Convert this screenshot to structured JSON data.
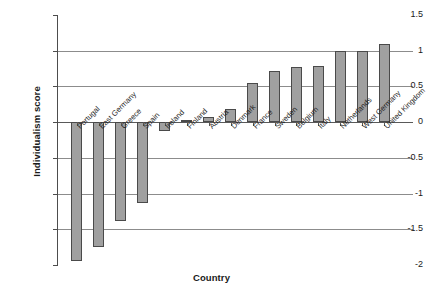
{
  "chart_data": {
    "type": "bar",
    "title": "",
    "xlabel": "Country",
    "ylabel": "Individualism score",
    "ylim": [
      -2,
      1.5
    ],
    "yticks": [
      1.5,
      1,
      0.5,
      0,
      -0.5,
      -1,
      -1.5,
      -2
    ],
    "ytick_labels": [
      "1.5",
      "1",
      "0.5",
      "0",
      "-0.5",
      "-1",
      "-1.5",
      "-2"
    ],
    "grid": true,
    "legend": false,
    "bar_color": "#a0a0a0",
    "bar_edge_color": "#4a4a4a",
    "categories": [
      "Portugal",
      "East Germany",
      "Greece",
      "Spain",
      "Ireland",
      "Finland",
      "Austria",
      "Denmark",
      "France",
      "Sweden",
      "Belgium",
      "Italy",
      "Netherlands",
      "West Germany",
      "United Kingdom"
    ],
    "values": [
      -1.95,
      -1.75,
      -1.38,
      -1.13,
      -0.12,
      0.03,
      0.07,
      0.18,
      0.55,
      0.72,
      0.77,
      0.78,
      1.0,
      1.0,
      1.1
    ]
  }
}
